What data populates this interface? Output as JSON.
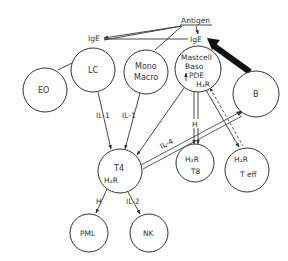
{
  "diagram": {
    "labels": {
      "antigen": "Antigen",
      "ige_left": "IgE",
      "ige_right": "IgE",
      "il1_left": "IL-1",
      "il1_right": "IL-1",
      "il4": "IL-4",
      "h_mast_t8": "H",
      "h_t4_pml": "H",
      "il2": "IL-2"
    },
    "nodes": {
      "eo": {
        "label": "EO"
      },
      "lc": {
        "label": "LC"
      },
      "mono": {
        "line1": "Mono",
        "line2": "Macro"
      },
      "mast": {
        "line1": "Mastcell",
        "line2": "Baso",
        "line3": "PDE",
        "line4": "H₂R"
      },
      "b": {
        "label": "B"
      },
      "t4": {
        "label": "T4",
        "sub": "H₂R"
      },
      "t8": {
        "sub": "H₂R",
        "label": "T8"
      },
      "teff": {
        "sub": "H₂R",
        "label": "T eff"
      },
      "pml": {
        "label": "PML"
      },
      "nk": {
        "label": "NK"
      }
    },
    "colors": {
      "stroke": "#333333",
      "background": "#ffffff"
    }
  }
}
